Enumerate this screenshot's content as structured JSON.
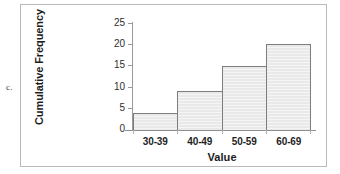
{
  "choice": {
    "letter": "c."
  },
  "chart_data": {
    "type": "bar",
    "title": "",
    "subtitle": "",
    "xlabel": "Value",
    "ylabel": "Cumulative Frequency",
    "categories": [
      "30-39",
      "40-49",
      "50-59",
      "60-69"
    ],
    "values": [
      4,
      9,
      15,
      20
    ],
    "series": [
      {
        "name": "Cumulative Frequency",
        "values": [
          4,
          9,
          15,
          20
        ]
      }
    ],
    "ylim": [
      0,
      25
    ],
    "ytick_labels": [
      "0",
      "5",
      "10",
      "15",
      "20",
      "25"
    ],
    "ytick_values": [
      0,
      5,
      10,
      15,
      20,
      25
    ],
    "grid": false,
    "legend": false,
    "legend_position": "none",
    "bar_gap": 0,
    "colors": {
      "bar_fill": "#e9e9e9",
      "bar_border": "#7d7d7d",
      "axis": "#9a9a9a",
      "text": "#1c1c1c",
      "panel_border": "#b9b9b9",
      "background": "#ffffff"
    }
  }
}
